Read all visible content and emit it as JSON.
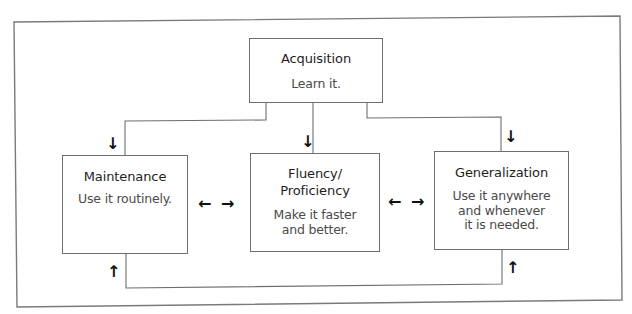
{
  "diagram": {
    "acquisition": {
      "title": "Acquisition",
      "text": "Learn it."
    },
    "maintenance": {
      "title": "Maintenance",
      "text": "Use it routinely."
    },
    "fluency": {
      "title": "Fluency/\nProficiency",
      "text": "Make it faster\nand better."
    },
    "generalization": {
      "title": "Generalization",
      "text": "Use it anywhere\nand whenever\nit is needed."
    },
    "arrows": {
      "down": "↓",
      "up": "↑",
      "left": "←",
      "right": "→"
    },
    "colors": {
      "line": "#6e6e6e",
      "frame": "#7a7a7a",
      "title_text": "#1e1e1e",
      "body_text": "#4a4a4a",
      "arrow": "#111111"
    }
  }
}
